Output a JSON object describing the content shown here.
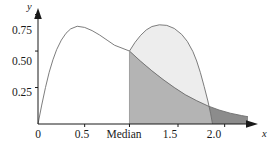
{
  "figure": {
    "background_color": "#ffffff",
    "axis_color": "#1a1a1a",
    "curve_color": "#6e6e6e"
  },
  "chart_data": {
    "type": "area",
    "title": "",
    "subtitle": "",
    "xlabel": "x",
    "ylabel": "y",
    "xlim": [
      0,
      2.25
    ],
    "ylim": [
      0,
      0.85
    ],
    "grid": false,
    "legend": "none",
    "x_ticks": [
      {
        "value": 0,
        "label": "0"
      },
      {
        "value": 0.5,
        "label": "0.5"
      },
      {
        "value": 0.98,
        "label": "Median"
      },
      {
        "value": 1.5,
        "label": "1.5"
      },
      {
        "value": 2.0,
        "label": "2.0"
      }
    ],
    "y_ticks": [
      {
        "value": 0.25,
        "label": "0.25"
      },
      {
        "value": 0.5,
        "label": "0.50"
      },
      {
        "value": 0.75,
        "label": "0.75"
      }
    ],
    "annotations": [
      {
        "name": "median-marker",
        "x": 0.98,
        "label": "Median",
        "y_at_curve": 0.5
      }
    ],
    "series": [
      {
        "name": "density-curve-left",
        "kind": "line",
        "fill": "none",
        "peak": {
          "x": 0.42,
          "y": 0.67
        },
        "points": [
          [
            0.0,
            0.0
          ],
          [
            0.04,
            0.13
          ],
          [
            0.08,
            0.25
          ],
          [
            0.12,
            0.355
          ],
          [
            0.16,
            0.44
          ],
          [
            0.2,
            0.51
          ],
          [
            0.25,
            0.575
          ],
          [
            0.3,
            0.622
          ],
          [
            0.35,
            0.652
          ],
          [
            0.42,
            0.67
          ],
          [
            0.5,
            0.662
          ],
          [
            0.58,
            0.64
          ],
          [
            0.66,
            0.61
          ],
          [
            0.74,
            0.575
          ],
          [
            0.82,
            0.54
          ],
          [
            0.9,
            0.52
          ],
          [
            0.98,
            0.5
          ],
          [
            1.1,
            0.43
          ],
          [
            1.22,
            0.365
          ],
          [
            1.34,
            0.305
          ],
          [
            1.46,
            0.25
          ],
          [
            1.58,
            0.2
          ],
          [
            1.7,
            0.16
          ],
          [
            1.82,
            0.124
          ],
          [
            1.94,
            0.096
          ],
          [
            2.06,
            0.074
          ],
          [
            2.18,
            0.058
          ],
          [
            2.25,
            0.05
          ]
        ]
      },
      {
        "name": "density-curve-right",
        "kind": "line",
        "fill": "light-gray",
        "peak": {
          "x": 1.3,
          "y": 0.68
        },
        "points": [
          [
            0.98,
            0.5
          ],
          [
            1.04,
            0.56
          ],
          [
            1.1,
            0.608
          ],
          [
            1.16,
            0.645
          ],
          [
            1.22,
            0.668
          ],
          [
            1.3,
            0.68
          ],
          [
            1.38,
            0.676
          ],
          [
            1.46,
            0.655
          ],
          [
            1.54,
            0.614
          ],
          [
            1.6,
            0.566
          ],
          [
            1.66,
            0.496
          ],
          [
            1.7,
            0.432
          ],
          [
            1.74,
            0.352
          ],
          [
            1.78,
            0.258
          ],
          [
            1.82,
            0.158
          ],
          [
            1.85,
            0.07
          ],
          [
            1.87,
            0.0
          ]
        ]
      }
    ],
    "shaded_regions": [
      {
        "name": "overlap-region",
        "color": "#b4b4b4",
        "description": "region under left curve to the right of the median"
      },
      {
        "name": "right-curve-region",
        "color": "#ededed",
        "description": "region under right curve to the right of the median"
      },
      {
        "name": "tail-region",
        "color": "#8c8c8c",
        "description": "dark tail under left curve beyond right curve crossing"
      }
    ]
  }
}
